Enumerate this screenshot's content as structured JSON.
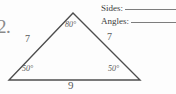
{
  "worksheet": {
    "problem_number": "2.",
    "answer_prompts": [
      {
        "label": "Sides:",
        "value": ""
      },
      {
        "label": "Angles:",
        "value": ""
      }
    ]
  },
  "figure": {
    "type": "triangle",
    "shape_name": "isosceles-triangle",
    "stroke_color": "#4d4d4d",
    "sides": [
      {
        "position": "left",
        "length": "7"
      },
      {
        "position": "right",
        "length": "7"
      },
      {
        "position": "base",
        "length": "9"
      }
    ],
    "angles": [
      {
        "position": "apex",
        "measure": "80°"
      },
      {
        "position": "bottom-left",
        "measure": "50°"
      },
      {
        "position": "bottom-right",
        "measure": "50°"
      }
    ],
    "vertices": {
      "apex": {
        "x": 73,
        "y": 13
      },
      "bottom_left": {
        "x": 9,
        "y": 80
      },
      "bottom_right": {
        "x": 140,
        "y": 80
      }
    }
  }
}
